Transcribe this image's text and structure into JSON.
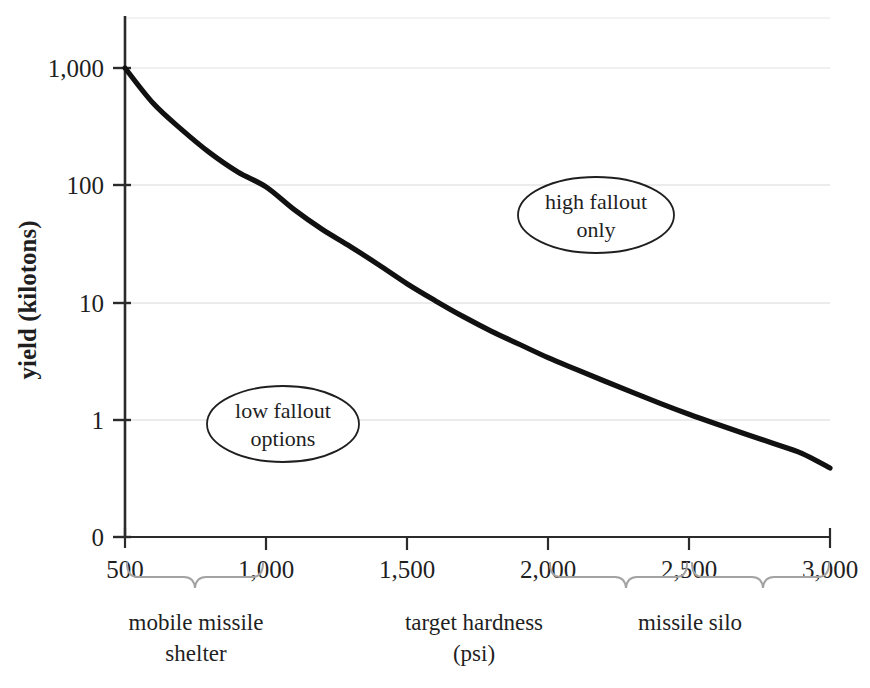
{
  "chart_data": {
    "type": "line",
    "title": "",
    "subtitle": "",
    "xlabel": "target hardness (psi)",
    "ylabel": "yield (kilotons)",
    "xlim": [
      500,
      3000
    ],
    "ylim_log": [
      0.3,
      1000
    ],
    "yscale": "log",
    "grid": true,
    "legend_position": "none",
    "x_ticks": [
      "500",
      "1,000",
      "1,500",
      "2,000",
      "2,500",
      "3,000"
    ],
    "x_tick_values": [
      500,
      1000,
      1500,
      2000,
      2500,
      3000
    ],
    "y_ticks": [
      "1,000",
      "100",
      "10",
      "1",
      "0"
    ],
    "y_tick_values": [
      1000,
      100,
      10,
      1,
      0
    ],
    "series": [
      {
        "name": "required yield vs target hardness",
        "x": [
          500,
          600,
          700,
          800,
          900,
          1000,
          1100,
          1200,
          1300,
          1400,
          1500,
          1600,
          1700,
          1800,
          1900,
          2000,
          2100,
          2200,
          2300,
          2400,
          2500,
          2600,
          2700,
          2800,
          2900,
          3000
        ],
        "y": [
          1000,
          500,
          300,
          190,
          130,
          97,
          62,
          42,
          30,
          21,
          14.5,
          10.4,
          7.6,
          5.7,
          4.4,
          3.4,
          2.7,
          2.15,
          1.72,
          1.38,
          1.12,
          0.92,
          0.76,
          0.63,
          0.52,
          0.39
        ]
      }
    ],
    "annotations": [
      {
        "id": "high-fallout",
        "text_line1": "high fallout",
        "text_line2": "only",
        "shape": "ellipse",
        "x": 2270,
        "y_approx": 250
      },
      {
        "id": "low-fallout",
        "text_line1": "low fallout",
        "text_line2": "options",
        "shape": "ellipse",
        "x": 1150,
        "y_approx": 1.1
      }
    ],
    "brackets": [
      {
        "id": "mobile-missile-shelter",
        "label_line1": "mobile missile",
        "label_line2": "shelter",
        "from": 500,
        "to": 1000
      },
      {
        "id": "target-hardness",
        "label_line1": "target hardness",
        "label_line2": "(psi)",
        "from": null,
        "to": null
      },
      {
        "id": "missile-silo",
        "label_line1": "missile silo",
        "label_line2": "",
        "from": 2000,
        "to": 3000
      }
    ]
  },
  "axes": {
    "y_title": "yield (kilotons)",
    "y_tick_1000": "1,000",
    "y_tick_100": "100",
    "y_tick_10": "10",
    "y_tick_1": "1",
    "y_tick_0": "0",
    "x_tick_500": "500",
    "x_tick_1000": "1,000",
    "x_tick_1500": "1,500",
    "x_tick_2000": "2,000",
    "x_tick_2500": "2,500",
    "x_tick_3000": "3,000"
  },
  "annotations": {
    "high_fallout_line1": "high fallout",
    "high_fallout_line2": "only",
    "low_fallout_line1": "low fallout",
    "low_fallout_line2": "options"
  },
  "brackets": {
    "left_line1": "mobile missile",
    "left_line2": "shelter",
    "center_line1": "target hardness",
    "center_line2": "(psi)",
    "right_line1": "missile silo"
  },
  "colors": {
    "curve": "#111111",
    "axis": "#2b2b2b",
    "grid": "#d8d8d8",
    "bracket": "#9a9a9a",
    "text": "#1f1f1f",
    "background": "#ffffff"
  }
}
